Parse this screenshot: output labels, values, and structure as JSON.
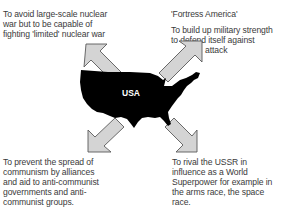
{
  "center": {
    "label": "USA",
    "map_color": "#000000",
    "label_color": "#ffffff"
  },
  "arrows": {
    "fill": "#d4d4d4",
    "stroke": "#5a5a5a",
    "directions": [
      "up-left",
      "up-right",
      "down-left",
      "down-right"
    ]
  },
  "aims": {
    "top_left": {
      "text": "To avoid large-scale nuclear\nwar but to be capable of\nfighting 'limited' nuclear war"
    },
    "top_right": {
      "title": "'Fortress America'",
      "text": "To build up military strength\nto defend itself against",
      "text_end": "attack"
    },
    "bottom_left": {
      "text": "To prevent the spread of\ncommunism by alliances\nand aid to anti-communist\ngovernments and anti-\ncommunist groups."
    },
    "bottom_right": {
      "text": "To rival the USSR in\ninfluence as a World\nSuperpower for example in\nthe arms race, the space\nrace."
    }
  }
}
